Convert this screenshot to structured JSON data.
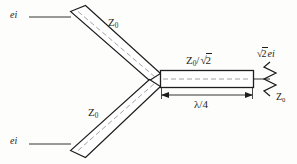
{
  "figure": {
    "background_color": "#fdfdfc",
    "line_color": "#1d1d1d",
    "centerline_color": "#8a8a8a"
  },
  "labels": {
    "input_top": "ei",
    "input_bottom": "ei",
    "impedance_top_arm": "Z",
    "impedance_top_arm_sub": "0",
    "impedance_bottom_arm": "Z",
    "impedance_bottom_arm_sub": "0",
    "quarter_wave_impedance_num": "Z",
    "quarter_wave_impedance_sub": "0",
    "quarter_wave_impedance_div": "/",
    "quarter_wave_radical_sign": "√",
    "quarter_wave_radicand": "2",
    "length_label": "λ/4",
    "output_radical_sign": "√",
    "output_radicand": "2",
    "output_signal": "ei",
    "load_impedance": "Z",
    "load_impedance_sub": "0"
  },
  "elements": {
    "top_arm_name": "upper-input-transmission-line",
    "bottom_arm_name": "lower-input-transmission-line",
    "quarter_wave_name": "quarter-wave-transformer-section",
    "resistor_name": "load-resistor",
    "dimension_name": "length-dimension-line"
  }
}
